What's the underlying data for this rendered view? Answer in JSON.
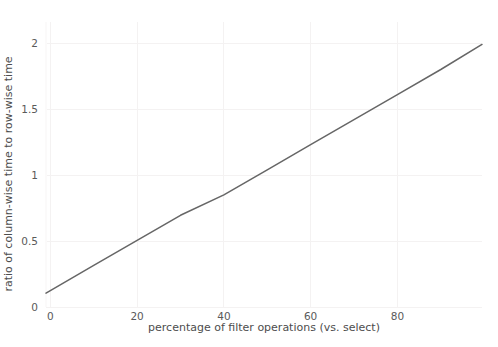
{
  "chart_data": {
    "type": "line",
    "title": "",
    "xlabel": "percentage of filter operations (vs. select)",
    "ylabel": "ratio of column-wise time to row-wise time",
    "xlim": [
      -1,
      99.5
    ],
    "ylim": [
      0,
      2.16
    ],
    "xticks": [
      0,
      20,
      40,
      60,
      80
    ],
    "xticklabels": [
      "0",
      "20",
      "40",
      "60",
      "80"
    ],
    "yticks": [
      0,
      0.5,
      1,
      1.5,
      2
    ],
    "yticklabels": [
      "0",
      "0.5",
      "1",
      "1.5",
      "2"
    ],
    "grid": true,
    "legend": "none",
    "series": [
      {
        "name": "ratio",
        "color": "#666666",
        "x": [
          -1,
          0,
          10,
          20,
          30,
          40,
          50,
          60,
          70,
          80,
          90,
          99.5
        ],
        "values": [
          0.105,
          0.124,
          0.315,
          0.505,
          0.695,
          0.85,
          1.04,
          1.23,
          1.42,
          1.61,
          1.8,
          1.99
        ]
      }
    ]
  },
  "axes": {
    "xlabel": "percentage of filter operations (vs. select)",
    "ylabel": "ratio of column-wise time to row-wise time"
  },
  "colors": {
    "line": "#666666",
    "grid": "#f4f2f2",
    "tick_text": "#5a5a5a",
    "label_text": "#4d4d4d",
    "background": "#ffffff"
  }
}
